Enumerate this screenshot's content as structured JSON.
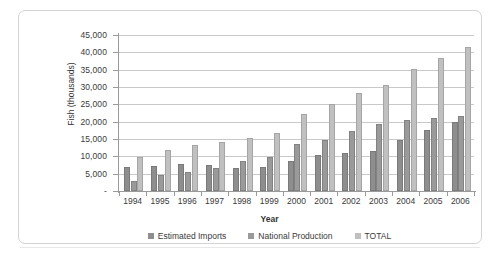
{
  "chart_data": {
    "type": "bar",
    "title": "",
    "subtitle": "",
    "xlabel": "Year",
    "ylabel": "Fish (thousands)",
    "categories": [
      "1994",
      "1995",
      "1996",
      "1997",
      "1998",
      "1999",
      "2000",
      "2001",
      "2002",
      "2003",
      "2004",
      "2005",
      "2006"
    ],
    "series": [
      {
        "name": "Estimated Imports",
        "color": "#8e8e8e",
        "values": [
          7000,
          7200,
          7800,
          7400,
          6500,
          7000,
          8700,
          10400,
          11000,
          11500,
          14600,
          17500,
          20000
        ]
      },
      {
        "name": "National Production",
        "color": "#9a9a9a",
        "values": [
          2800,
          4700,
          5500,
          6700,
          8800,
          9800,
          13600,
          14800,
          17300,
          19200,
          20600,
          21000,
          21500
        ]
      },
      {
        "name": "TOTAL",
        "color": "#c0c0c0",
        "values": [
          9800,
          11900,
          13300,
          14100,
          15300,
          16800,
          22300,
          25200,
          28300,
          30700,
          35200,
          38500,
          41500
        ]
      }
    ],
    "ylim": [
      0,
      45000
    ],
    "ytick_values": [
      0,
      5000,
      10000,
      15000,
      20000,
      25000,
      30000,
      35000,
      40000,
      45000
    ],
    "ytick_labels": [
      "-",
      "5,000",
      "10,000",
      "15,000",
      "20,000",
      "25,000",
      "30,000",
      "35,000",
      "40,000",
      "45,000"
    ],
    "grid": true,
    "legend_position": "bottom",
    "legend_entries": [
      "Estimated Imports",
      "National Production",
      "TOTAL"
    ]
  },
  "colors": {
    "imports": "#8e8e8e",
    "production": "#9a9a9a",
    "total": "#c0c0c0",
    "gridline": "#c9c9c9",
    "axis": "#9a9a9a",
    "frame": "#d3d3d3",
    "text": "#3a3a3a",
    "background": "#ffffff"
  }
}
